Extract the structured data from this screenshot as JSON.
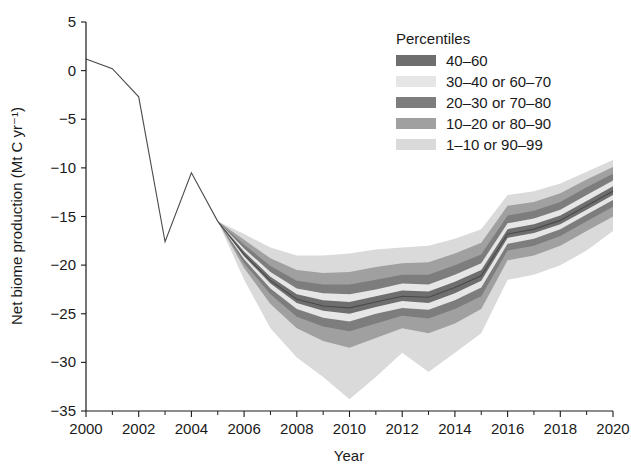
{
  "chart_data": {
    "type": "area",
    "title": "",
    "xlabel": "Year",
    "ylabel": "Net biome production (Mt C yr⁻¹)",
    "xlim": [
      2000,
      2020
    ],
    "ylim": [
      -35,
      5
    ],
    "xticks": [
      2000,
      2002,
      2004,
      2006,
      2008,
      2010,
      2012,
      2014,
      2016,
      2018,
      2020
    ],
    "xticks_minor": [
      2001,
      2003,
      2005,
      2007,
      2009,
      2011,
      2013,
      2015,
      2017,
      2019
    ],
    "yticks": [
      5,
      0,
      -5,
      -10,
      -15,
      -20,
      -25,
      -30,
      -35
    ],
    "xtick_labels": [
      "2000",
      "2002",
      "2004",
      "2006",
      "2008",
      "2010",
      "2012",
      "2014",
      "2016",
      "2018",
      "2020"
    ],
    "ytick_labels": [
      "5",
      "0",
      "-5",
      "-10",
      "-15",
      "-20",
      "-25",
      "-30",
      "-35"
    ],
    "grid": false,
    "legend_position": "top-right",
    "legend_title": "Percentiles",
    "x": [
      2000,
      2001,
      2002,
      2003,
      2004,
      2005,
      2006,
      2007,
      2008,
      2009,
      2010,
      2011,
      2012,
      2013,
      2014,
      2015,
      2016,
      2017,
      2018,
      2019,
      2020
    ],
    "series": [
      {
        "name": "p1",
        "label": "1st percentile",
        "values": [
          1.2,
          0.2,
          -2.7,
          -17.6,
          -10.5,
          -15.5,
          -21.5,
          -26.5,
          -29.5,
          -31.5,
          -33.8,
          -31.5,
          -29.0,
          -31.0,
          -29.0,
          -27.0,
          -21.5,
          -21.0,
          -20.0,
          -18.5,
          -16.5
        ]
      },
      {
        "name": "p10",
        "label": "10th percentile",
        "values": [
          1.2,
          0.2,
          -2.7,
          -17.6,
          -10.5,
          -15.5,
          -20.3,
          -24.0,
          -26.5,
          -27.8,
          -28.5,
          -27.5,
          -26.5,
          -27.0,
          -26.0,
          -24.5,
          -19.5,
          -19.0,
          -18.0,
          -16.5,
          -15.0
        ]
      },
      {
        "name": "p20",
        "label": "20th percentile",
        "values": [
          1.2,
          0.2,
          -2.7,
          -17.6,
          -10.5,
          -15.5,
          -19.8,
          -23.0,
          -25.3,
          -26.3,
          -26.8,
          -26.0,
          -25.2,
          -25.5,
          -24.5,
          -23.2,
          -18.5,
          -18.0,
          -17.0,
          -15.5,
          -14.0
        ]
      },
      {
        "name": "p30",
        "label": "30th percentile",
        "values": [
          1.2,
          0.2,
          -2.7,
          -17.6,
          -10.5,
          -15.5,
          -19.4,
          -22.4,
          -24.5,
          -25.4,
          -25.8,
          -25.0,
          -24.4,
          -24.6,
          -23.6,
          -22.3,
          -17.8,
          -17.3,
          -16.3,
          -14.8,
          -13.3
        ]
      },
      {
        "name": "p40",
        "label": "40th percentile",
        "values": [
          1.2,
          0.2,
          -2.7,
          -17.6,
          -10.5,
          -15.5,
          -19.1,
          -21.9,
          -23.9,
          -24.7,
          -25.0,
          -24.3,
          -23.7,
          -23.9,
          -22.9,
          -21.6,
          -17.2,
          -16.7,
          -15.8,
          -14.3,
          -12.8
        ]
      },
      {
        "name": "p50",
        "label": "Median (50th percentile)",
        "values": [
          1.2,
          0.2,
          -2.7,
          -17.6,
          -10.5,
          -15.5,
          -18.9,
          -21.6,
          -23.5,
          -24.2,
          -24.4,
          -23.8,
          -23.2,
          -23.3,
          -22.3,
          -21.1,
          -16.8,
          -16.3,
          -15.4,
          -13.9,
          -12.4
        ]
      },
      {
        "name": "p60",
        "label": "60th percentile",
        "values": [
          1.2,
          0.2,
          -2.7,
          -17.6,
          -10.5,
          -15.5,
          -18.6,
          -21.2,
          -23.0,
          -23.6,
          -23.8,
          -23.2,
          -22.6,
          -22.7,
          -21.7,
          -20.5,
          -16.3,
          -15.8,
          -14.9,
          -13.4,
          -11.9
        ]
      },
      {
        "name": "p70",
        "label": "70th percentile",
        "values": [
          1.2,
          0.2,
          -2.7,
          -17.6,
          -10.5,
          -15.5,
          -18.3,
          -20.7,
          -22.4,
          -22.9,
          -23.0,
          -22.5,
          -21.9,
          -22.0,
          -21.0,
          -19.8,
          -15.7,
          -15.2,
          -14.3,
          -12.8,
          -11.3
        ]
      },
      {
        "name": "p80",
        "label": "80th percentile",
        "values": [
          1.2,
          0.2,
          -2.7,
          -17.6,
          -10.5,
          -15.5,
          -17.9,
          -20.1,
          -21.6,
          -22.0,
          -22.0,
          -21.5,
          -21.0,
          -21.0,
          -20.0,
          -18.9,
          -14.9,
          -14.4,
          -13.5,
          -12.0,
          -10.6
        ]
      },
      {
        "name": "p90",
        "label": "90th percentile",
        "values": [
          1.2,
          0.2,
          -2.7,
          -17.6,
          -10.5,
          -15.5,
          -17.4,
          -19.3,
          -20.5,
          -20.8,
          -20.7,
          -20.2,
          -19.8,
          -19.7,
          -18.8,
          -17.7,
          -13.9,
          -13.5,
          -12.6,
          -11.2,
          -9.9
        ]
      },
      {
        "name": "p99",
        "label": "99th percentile",
        "values": [
          1.2,
          0.2,
          -2.7,
          -17.6,
          -10.5,
          -15.5,
          -16.8,
          -18.2,
          -19.0,
          -19.0,
          -18.8,
          -18.4,
          -18.2,
          -18.0,
          -17.3,
          -16.3,
          -12.8,
          -12.4,
          -11.6,
          -10.4,
          -9.2
        ]
      }
    ]
  },
  "legend": {
    "title": "Percentiles",
    "items": [
      {
        "label": "40–60",
        "color": "#6e6e6e"
      },
      {
        "label": "30–40 or 60–70",
        "color": "#e6e6e6"
      },
      {
        "label": "20–30 or 70–80",
        "color": "#7d7d7d"
      },
      {
        "label": "10–20 or 80–90",
        "color": "#a0a0a0"
      },
      {
        "label": "1–10 or 90–99",
        "color": "#dadada"
      }
    ]
  },
  "colors": {
    "band_40_60": "#6e6e6e",
    "band_30_40_60_70": "#e6e6e6",
    "band_20_30_70_80": "#7d7d7d",
    "band_10_20_80_90": "#a0a0a0",
    "band_1_10_90_99": "#dadada",
    "axis": "#1a1a1a",
    "background": "#ffffff"
  }
}
